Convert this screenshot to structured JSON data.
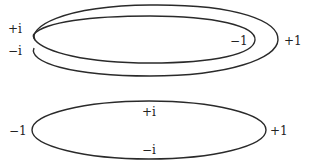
{
  "colors": {
    "stroke": "#2a2a2a",
    "text": "#222222",
    "background": "#ffffff"
  },
  "top_figure": {
    "description": "twisted double loop (two nested curves crossing at left)",
    "labels": {
      "plus_i": "+i",
      "minus_i": "−i",
      "minus_one": "−1",
      "plus_one": "+1"
    }
  },
  "bottom_figure": {
    "description": "single ellipse",
    "labels": {
      "minus_one": "−1",
      "plus_one": "+1",
      "plus_i": "+i",
      "minus_i": "−i"
    }
  }
}
